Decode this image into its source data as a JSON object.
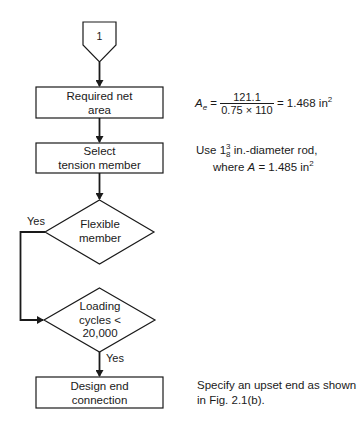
{
  "flowchart": {
    "connector": {
      "label": "1"
    },
    "nodes": [
      {
        "id": "required-net-area",
        "type": "process",
        "line1": "Required net",
        "line2": "area"
      },
      {
        "id": "select-tension-member",
        "type": "process",
        "line1": "Select",
        "line2": "tension member"
      },
      {
        "id": "flexible-member",
        "type": "decision",
        "line1": "Flexible",
        "line2": "member"
      },
      {
        "id": "loading-cycles",
        "type": "decision",
        "line1": "Loading",
        "line2": "cycles <",
        "line3": "20,000"
      },
      {
        "id": "design-end-connection",
        "type": "process",
        "line1": "Design end",
        "line2": "connection"
      }
    ],
    "edge_labels": {
      "flexible_yes": "Yes",
      "loading_yes": "Yes"
    },
    "colors": {
      "stroke": "#1a1a1a",
      "background": "#ffffff"
    }
  },
  "notes": {
    "net_area": {
      "variable": "A",
      "subscript": "e",
      "numerator": "121.1",
      "denominator": "0.75 × 110",
      "result": "= 1.468 in",
      "result_exp": "2"
    },
    "tension_member": {
      "line1_prefix": "Use 1",
      "fraction_num": "3",
      "fraction_den": "8",
      "line1_suffix": " in.-diameter rod,",
      "line2_prefix": "where ",
      "line2_var": "A",
      "line2_value": " = 1.485 in",
      "line2_exp": "2"
    },
    "end_connection": {
      "line1": "Specify an upset end as shown",
      "line2": "in Fig. 2.1(b)."
    }
  }
}
